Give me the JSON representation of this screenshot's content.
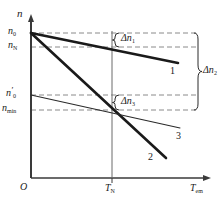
{
  "figure": {
    "type": "line",
    "axis": {
      "y_label": "n",
      "x_label": "T",
      "x_label_sub": "em",
      "origin_label": "O"
    },
    "y_ticks": [
      {
        "id": "n0",
        "base": "n",
        "sub": "0",
        "prime": false,
        "y": 33
      },
      {
        "id": "nN",
        "base": "n",
        "sub": "N",
        "prime": false,
        "y": 47
      },
      {
        "id": "n0p",
        "base": "n",
        "sub": "0",
        "prime": true,
        "y": 95
      },
      {
        "id": "nmin",
        "base": "n",
        "sub": "min",
        "prime": false,
        "y": 110
      }
    ],
    "x_ticks": [
      {
        "id": "TN",
        "base": "T",
        "sub": "N",
        "x": 112
      }
    ],
    "curves": [
      {
        "label": "1",
        "style": "thick",
        "from": "n0",
        "to_y": 63,
        "note": "gentle droop, passes nN at TN"
      },
      {
        "label": "2",
        "style": "thick",
        "from": "n0",
        "to_y": 158,
        "note": "steep droop, passes nmin at TN"
      },
      {
        "label": "3",
        "style": "thin",
        "from": "n0p",
        "to_y": 128,
        "note": "gentle droop, passes nmin at TN"
      }
    ],
    "braces": [
      {
        "id": "dn1",
        "base": "Δn",
        "sub": "1",
        "from": "n0",
        "to": "nN"
      },
      {
        "id": "dn3",
        "base": "Δn",
        "sub": "3",
        "from": "n0p",
        "to": "nmin"
      },
      {
        "id": "dn2",
        "base": "Δn",
        "sub": "2",
        "from": "n0",
        "to": "nmin"
      }
    ],
    "colors": {
      "axis": "#333333",
      "curve": "#1a1a1a",
      "dashed": "#888888",
      "text": "#1a1a1a"
    }
  }
}
